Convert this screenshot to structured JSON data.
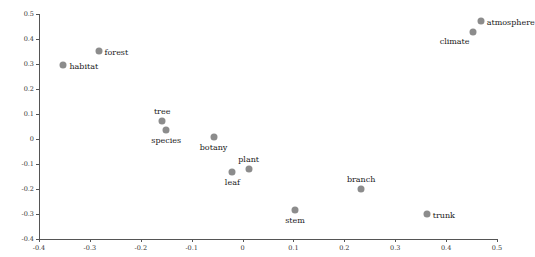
{
  "chart_data": {
    "type": "scatter",
    "title": "",
    "xlabel": "",
    "ylabel": "",
    "xlim": [
      -0.4,
      0.5
    ],
    "ylim": [
      -0.4,
      0.5
    ],
    "grid": false,
    "legend": "none",
    "xticks": [
      "-0.4",
      "-0.3",
      "-0.2",
      "-0.1",
      "0",
      "0.1",
      "0.2",
      "0.3",
      "0.4",
      "0.5"
    ],
    "yticks": [
      "-0.4",
      "-0.3",
      "-0.2",
      "-0.1",
      "0",
      "0.1",
      "0.2",
      "0.3",
      "0.4",
      "0.5"
    ],
    "xtick_values": [
      -0.4,
      -0.3,
      -0.2,
      -0.1,
      0,
      0.1,
      0.2,
      0.3,
      0.4,
      0.5
    ],
    "ytick_values": [
      -0.4,
      -0.3,
      -0.2,
      -0.1,
      0,
      0.1,
      0.2,
      0.3,
      0.4,
      0.5
    ],
    "point_color": "#8c8c8c",
    "axis_color": "#555555",
    "points": [
      {
        "label": "atmosphere",
        "x": 0.468,
        "y": 0.472,
        "label_pos": "right"
      },
      {
        "label": "climate",
        "x": 0.452,
        "y": 0.428,
        "label_pos": "left-below"
      },
      {
        "label": "forest",
        "x": -0.283,
        "y": 0.352,
        "label_pos": "right"
      },
      {
        "label": "habitat",
        "x": -0.352,
        "y": 0.296,
        "label_pos": "right"
      },
      {
        "label": "tree",
        "x": -0.158,
        "y": 0.072,
        "label_pos": "above"
      },
      {
        "label": "species",
        "x": -0.15,
        "y": 0.038,
        "label_pos": "below"
      },
      {
        "label": "botany",
        "x": -0.057,
        "y": 0.008,
        "label_pos": "below"
      },
      {
        "label": "plant",
        "x": 0.012,
        "y": -0.12,
        "label_pos": "above"
      },
      {
        "label": "leaf",
        "x": -0.02,
        "y": -0.13,
        "label_pos": "below"
      },
      {
        "label": "branch",
        "x": 0.233,
        "y": -0.2,
        "label_pos": "above"
      },
      {
        "label": "stem",
        "x": 0.103,
        "y": -0.285,
        "label_pos": "below"
      },
      {
        "label": "trunk",
        "x": 0.362,
        "y": -0.298,
        "label_pos": "right"
      }
    ]
  }
}
